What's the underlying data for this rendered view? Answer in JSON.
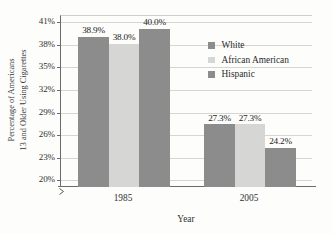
{
  "chart_data": {
    "type": "bar",
    "title": "",
    "subtitle": "",
    "xlabel": "Year",
    "ylabel": "Percentage of Americans 13 and Older Using Cigarettes",
    "ylabel_lines": [
      "Percentage of Americans",
      "13 and Older Using Cigarettes"
    ],
    "categories": [
      "1985",
      "2005"
    ],
    "series": [
      {
        "name": "White",
        "values": [
          38.9,
          27.3
        ],
        "labels": [
          "38.9%",
          "27.3%"
        ],
        "color": "#8c8c8c"
      },
      {
        "name": "African American",
        "values": [
          38.0,
          27.3
        ],
        "labels": [
          "38.0%",
          "27.3%"
        ],
        "color": "#d6d6d4"
      },
      {
        "name": "Hispanic",
        "values": [
          40.0,
          24.2
        ],
        "labels": [
          "40.0%",
          "24.2%"
        ],
        "color": "#8c8c8c"
      }
    ],
    "ylim": [
      19,
      41.8
    ],
    "yticks": [
      20,
      23,
      26,
      29,
      32,
      35,
      38,
      41
    ],
    "ytick_labels": [
      "20%",
      "23%",
      "26%",
      "29%",
      "32%",
      "35%",
      "38%",
      "41%"
    ],
    "ytick_step": 3,
    "y_axis_break": true,
    "grid": true,
    "grid_axis": "y",
    "legend_position": "inside-upper-right",
    "legend_entries": [
      "White",
      "African American",
      "Hispanic"
    ]
  },
  "colors": {
    "bar_dark": "#8c8c8c",
    "bar_light": "#d6d6d4",
    "gridline": "#d6d6d0",
    "axis": "#6b6b6b",
    "background": "#fdfdfb",
    "text": "#2f2f2f"
  }
}
